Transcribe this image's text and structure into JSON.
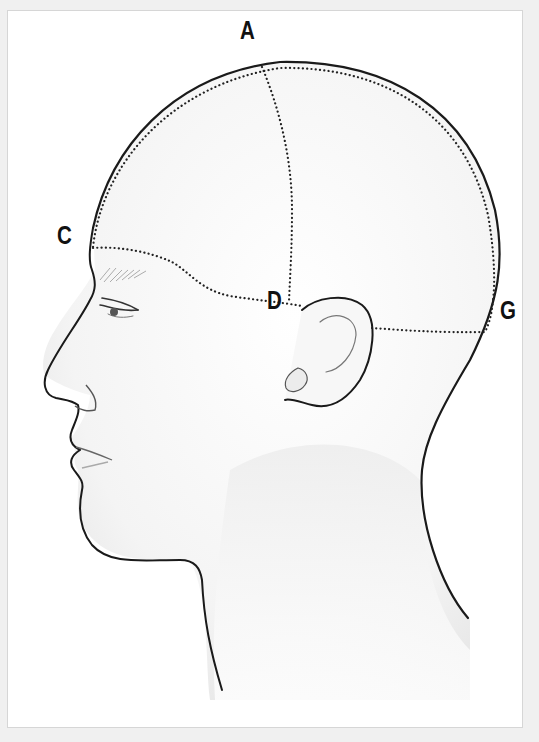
{
  "figure": {
    "type": "anatomical-illustration",
    "labels": [
      {
        "id": "A",
        "text": "A",
        "x": 240,
        "y": 18
      },
      {
        "id": "C",
        "text": "C",
        "x": 57,
        "y": 223
      },
      {
        "id": "D",
        "text": "D",
        "x": 267,
        "y": 288
      },
      {
        "id": "G",
        "text": "G",
        "x": 500,
        "y": 298
      }
    ],
    "colors": {
      "background": "#f0f0f0",
      "panel": "#ffffff",
      "outline": "#1a1a1a",
      "dotted_line": "#333333",
      "shading": "#e6e6e6"
    }
  }
}
